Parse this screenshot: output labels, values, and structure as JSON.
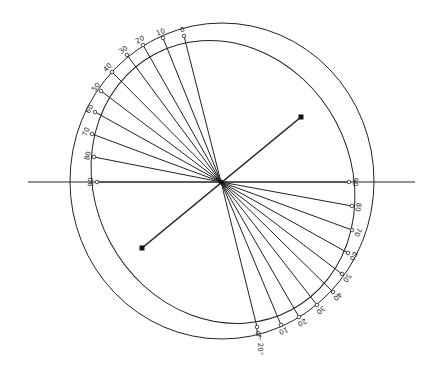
{
  "diagram": {
    "center": [
      221,
      182
    ],
    "outer_circle": {
      "cx": 222,
      "cy": 181,
      "rx": 152,
      "ry": 158
    },
    "inner_ellipse": {
      "cx": 223,
      "cy": 182,
      "rx": 128,
      "ry": 145,
      "rotate": -28
    },
    "horizontal_line": {
      "x1": 28,
      "x2": 415,
      "y": 182
    },
    "axis_line": {
      "x1": 142,
      "y1": 248,
      "x2": 301,
      "y2": 117
    },
    "upper_ticks": [
      {
        "label": "0",
        "x": 184,
        "y": 36
      },
      {
        "label": "10",
        "x": 163,
        "y": 38
      },
      {
        "label": "20",
        "x": 143,
        "y": 45
      },
      {
        "label": "30",
        "x": 127,
        "y": 55
      },
      {
        "label": "40",
        "x": 112,
        "y": 72
      },
      {
        "label": "50",
        "x": 101,
        "y": 91
      },
      {
        "label": "60",
        "x": 95,
        "y": 112
      },
      {
        "label": "70",
        "x": 92,
        "y": 134
      },
      {
        "label": "80",
        "x": 94,
        "y": 157
      },
      {
        "label": "90",
        "x": 97,
        "y": 182
      }
    ],
    "lower_ticks": [
      {
        "label": "90",
        "x": 349,
        "y": 182
      },
      {
        "label": "80",
        "x": 352,
        "y": 206
      },
      {
        "label": "70",
        "x": 352,
        "y": 230
      },
      {
        "label": "60",
        "x": 348,
        "y": 253
      },
      {
        "label": "50",
        "x": 342,
        "y": 274
      },
      {
        "label": "40",
        "x": 333,
        "y": 292
      },
      {
        "label": "30",
        "x": 317,
        "y": 305
      },
      {
        "label": "20",
        "x": 299,
        "y": 317
      },
      {
        "label": "10",
        "x": 281,
        "y": 325
      },
      {
        "label": "0",
        "x": 257,
        "y": 327
      }
    ],
    "annotation": {
      "label": "20°",
      "arrow": "←",
      "x": 258,
      "y": 345
    }
  }
}
